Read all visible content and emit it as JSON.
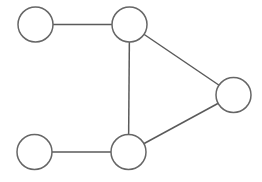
{
  "diagram": {
    "type": "undirected-graph",
    "background": "#ffffff",
    "stroke_color": "#5a5a5a",
    "node_fill": "#ffffff",
    "node_radius": 17.5,
    "nodes": [
      {
        "id": "n1",
        "label": "",
        "cx": 35.5,
        "cy": 24.5
      },
      {
        "id": "n2",
        "label": "",
        "cx": 129.5,
        "cy": 24.5
      },
      {
        "id": "n3",
        "label": "",
        "cx": 233.5,
        "cy": 95
      },
      {
        "id": "n4",
        "label": "",
        "cx": 34.5,
        "cy": 152
      },
      {
        "id": "n5",
        "label": "",
        "cx": 128.5,
        "cy": 152
      }
    ],
    "edges": [
      {
        "from": "n1",
        "to": "n2"
      },
      {
        "from": "n2",
        "to": "n5"
      },
      {
        "from": "n2",
        "to": "n3"
      },
      {
        "from": "n5",
        "to": "n3"
      },
      {
        "from": "n4",
        "to": "n5"
      }
    ]
  }
}
